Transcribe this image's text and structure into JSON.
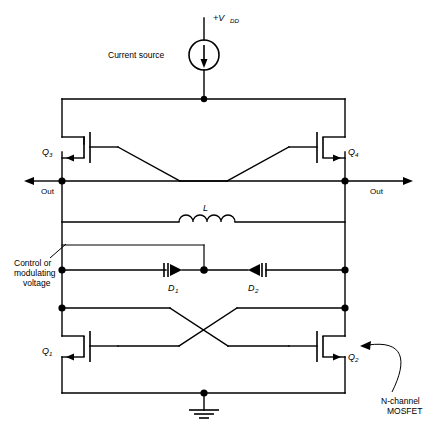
{
  "diagram": {
    "supply_label": "+V",
    "supply_sub": "DD",
    "current_source_label": "Current source",
    "inductor_label": "L",
    "control_voltage_line1": "Control or",
    "control_voltage_line2": "modulating",
    "control_voltage_line3": "voltage",
    "output_left_label": "Out",
    "output_right_label": "Out",
    "annotation_line1": "N-channel",
    "annotation_line2": "MOSFET",
    "ink_color": "#000000",
    "background_color": "#ffffff"
  },
  "components": {
    "transistors": [
      {
        "id": "q3",
        "label": "Q",
        "sub": "3",
        "position": "upper-left"
      },
      {
        "id": "q4",
        "label": "Q",
        "sub": "4",
        "position": "upper-right"
      },
      {
        "id": "q1",
        "label": "Q",
        "sub": "1",
        "position": "lower-left"
      },
      {
        "id": "q2",
        "label": "Q",
        "sub": "2",
        "position": "lower-right"
      }
    ],
    "diodes": [
      {
        "id": "d1",
        "label": "D",
        "sub": "1",
        "position": "left-varactor"
      },
      {
        "id": "d2",
        "label": "D",
        "sub": "2",
        "position": "right-varactor"
      }
    ],
    "inductor": {
      "id": "l1",
      "label": "L"
    },
    "ground": {
      "id": "gnd",
      "label": ""
    }
  }
}
